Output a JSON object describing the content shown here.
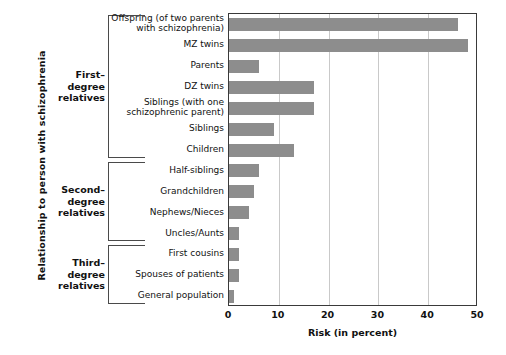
{
  "chart_data": {
    "type": "bar",
    "orientation": "horizontal",
    "title": "",
    "xlabel": "Risk (in percent)",
    "ylabel": "Relationship to person with schizophrenia",
    "xlim": [
      0,
      50
    ],
    "xticks": [
      0,
      10,
      20,
      30,
      40,
      50
    ],
    "xtick_labels": [
      "0",
      "10",
      "20",
      "30",
      "40",
      "50"
    ],
    "grid": "vertical",
    "legend": null,
    "bar_color": "#8d8d8d",
    "categories": [
      "Offspring (of two parents with schizophrenia)",
      "MZ twins",
      "Parents",
      "DZ twins",
      "Siblings (with one schizophrenic parent)",
      "Siblings",
      "Children",
      "Half-siblings",
      "Grandchildren",
      "Nephews/Nieces",
      "Uncles/Aunts",
      "First cousins",
      "Spouses  of patients",
      "General population"
    ],
    "values": [
      46,
      48,
      6,
      17,
      17,
      9,
      13,
      6,
      5,
      4,
      2,
      2,
      2,
      1
    ],
    "groups": [
      {
        "label": "First–\ndegree\nrelatives",
        "first": 0,
        "last": 6
      },
      {
        "label": "Second–\ndegree\nrelatives",
        "first": 7,
        "last": 10
      },
      {
        "label": "Third–\ndegree\nrelatives",
        "first": 11,
        "last": 13
      }
    ]
  },
  "axes": {
    "x_title": "Risk (in percent)",
    "y_title": "Relationship to person with schizophrenia"
  },
  "category_labels": [
    [
      "Offspring (of two parents",
      "with schizophrenia)"
    ],
    [
      "MZ twins"
    ],
    [
      "Parents"
    ],
    [
      "DZ twins"
    ],
    [
      "Siblings (with one",
      "schizophrenic parent)"
    ],
    [
      "Siblings"
    ],
    [
      "Children"
    ],
    [
      "Half-siblings"
    ],
    [
      "Grandchildren"
    ],
    [
      "Nephews/Nieces"
    ],
    [
      "Uncles/Aunts"
    ],
    [
      "First cousins"
    ],
    [
      "Spouses  of patients"
    ],
    [
      "General population"
    ]
  ],
  "group_labels": [
    [
      "First–",
      "degree",
      "relatives"
    ],
    [
      "Second–",
      "degree",
      "relatives"
    ],
    [
      "Third–",
      "degree",
      "relatives"
    ]
  ],
  "colors": {
    "bar": "#8d8d8d",
    "grid": "#c9c9c9",
    "axis": "#3a3a3a",
    "bracket": "#4a4a4a",
    "text": "#111111",
    "background": "#ffffff"
  }
}
